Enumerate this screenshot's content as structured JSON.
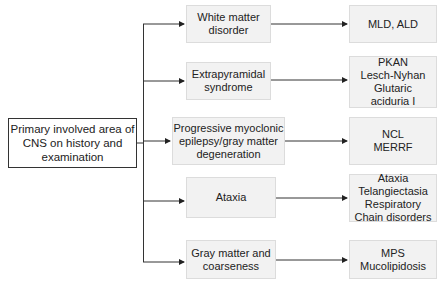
{
  "root": {
    "label": "Primary involved area of\nCNS on history and\nexamination"
  },
  "categories": [
    {
      "label": "White matter\ndisorder",
      "result": "MLD, ALD"
    },
    {
      "label": "Extrapyramidal\nsyndrome",
      "result": "PKAN\nLesch-Nyhan\nGlutaric\naciduria I"
    },
    {
      "label": "Progressive myoclonic\nepilepsy/gray matter\ndegeneration",
      "result": "NCL\nMERRF"
    },
    {
      "label": "Ataxia",
      "result": "Ataxia\nTelangiectasia\nRespiratory\nChain disorders"
    },
    {
      "label": "Gray matter and\ncoarseness",
      "result": "MPS\nMucolipidosis"
    }
  ],
  "colors": {
    "line": "#333333",
    "node_fill": "#f2f2f2",
    "node_border": "#dcdcdc"
  }
}
